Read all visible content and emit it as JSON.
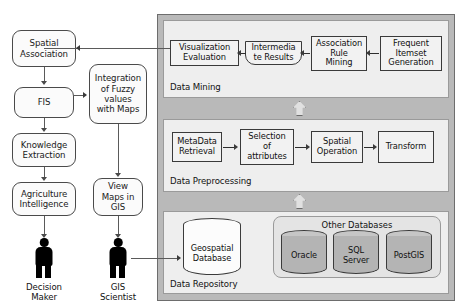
{
  "left_flow": {
    "boxes": [
      {
        "id": "spatial-association",
        "label": "Spatial\nAssociation"
      },
      {
        "id": "fis",
        "label": "FIS"
      },
      {
        "id": "knowledge-extraction",
        "label": "Knowledge\nExtraction"
      },
      {
        "id": "agriculture-intelligence",
        "label": "Agriculture\nIntelligence"
      },
      {
        "id": "integration-fuzzy",
        "label": "Integration\nof Fuzzy\nvalues\nwith Maps"
      },
      {
        "id": "view-maps-gis",
        "label": "View\nMaps in\nGIS"
      }
    ]
  },
  "actors": [
    {
      "id": "decision-maker",
      "label": "Decision\nMaker"
    },
    {
      "id": "gis-scientist",
      "label": "GIS\nScientist"
    }
  ],
  "bands": [
    {
      "id": "data-mining",
      "label": "Data Mining",
      "boxes": [
        {
          "id": "visualization-evaluation",
          "label": "Visualization\nEvaluation"
        },
        {
          "id": "intermediate-results",
          "label": "Intermedia\nte Results"
        },
        {
          "id": "association-rule-mining",
          "label": "Association\nRule\nMining"
        },
        {
          "id": "frequent-itemset-generation",
          "label": "Frequent\nItemset\nGeneration"
        }
      ]
    },
    {
      "id": "data-preprocessing",
      "label": "Data Preprocessing",
      "boxes": [
        {
          "id": "metadata-retrieval",
          "label": "MetaData\nRetrieval"
        },
        {
          "id": "selection-of-attributes",
          "label": "Selection\nof\nattributes"
        },
        {
          "id": "spatial-operation",
          "label": "Spatial\nOperation"
        },
        {
          "id": "transform",
          "label": "Transform"
        }
      ]
    },
    {
      "id": "data-repository",
      "label": "Data Repository",
      "group_title": "Other Databases",
      "databases": [
        {
          "id": "geospatial-database",
          "label": "Geospatial\nDatabase",
          "style": "light"
        },
        {
          "id": "oracle",
          "label": "Oracle",
          "style": "dark"
        },
        {
          "id": "sql-server",
          "label": "SQL\nServer",
          "style": "dark"
        },
        {
          "id": "postgis",
          "label": "PostGIS",
          "style": "dark"
        }
      ]
    }
  ],
  "colors": {
    "panel_bg": "#b9b9b9",
    "band_bg": "#eeeeee",
    "group_bg": "#e4e4e4",
    "box_bg": "#f2f2f2",
    "rbox_bg": "#fbfbfb",
    "cylinder_dark": "#b4b4b4",
    "cylinder_light": "#fcfcfc",
    "stroke": "#3a3a3a",
    "actor": "#000000"
  }
}
